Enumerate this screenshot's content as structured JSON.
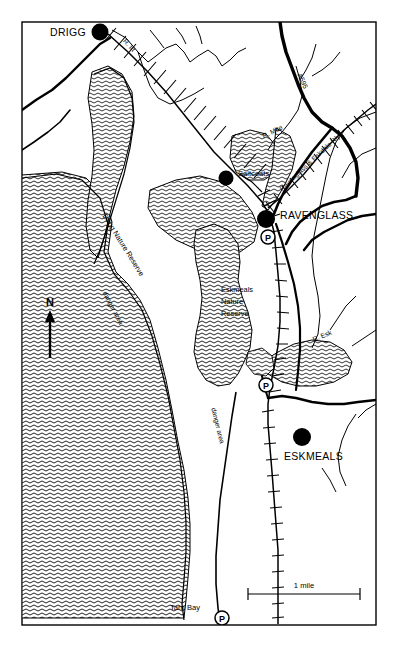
{
  "map": {
    "title": "Ravenglass, Drigg and Eskmeals area map",
    "frame": {
      "stroke": "#000000"
    },
    "background_color": "#ffffff",
    "ink_color": "#000000",
    "towns": [
      {
        "id": "drigg",
        "label": "DRIGG",
        "marker": "filled-circle"
      },
      {
        "id": "ravenglass",
        "label": "RAVENGLASS",
        "marker": "filled-circle"
      },
      {
        "id": "eskmeals",
        "label": "ESKMEALS",
        "marker": "filled-circle"
      }
    ],
    "places": [
      {
        "id": "saltcoats",
        "label": "Saltcoats",
        "marker": "filled-circle"
      },
      {
        "id": "tarn-bay",
        "label": "Tarn Bay",
        "marker": "none"
      }
    ],
    "reserves": [
      {
        "id": "drigg-nature-reserve",
        "label": "Drigg Nature Reserve",
        "orientation": "rotated"
      },
      {
        "id": "eskmeals-nature-reserve",
        "line1": "Eskmeals",
        "line2": "Nature",
        "line3": "Reserve",
        "orientation": "horizontal"
      }
    ],
    "danger_areas": [
      {
        "id": "danger-area-north",
        "label": "danger area"
      },
      {
        "id": "danger-area-south",
        "label": "danger area"
      }
    ],
    "rivers": [
      {
        "id": "river-irt",
        "label": "R. Irt"
      },
      {
        "id": "river-mite",
        "label": "R. Mite"
      },
      {
        "id": "river-esk",
        "label": "R. Esk"
      }
    ],
    "roads": [
      {
        "id": "a595",
        "label": "A595",
        "type": "primary"
      }
    ],
    "railways": [
      {
        "id": "ravenglass-eskdale-rly",
        "label": "Ravenglass & Eskdale Rly",
        "type": "narrow-gauge"
      },
      {
        "id": "main-line",
        "label": "",
        "type": "main-line"
      }
    ],
    "parking_markers": [
      {
        "id": "parking-ravenglass",
        "label": "P"
      },
      {
        "id": "parking-eskmeals",
        "label": "P"
      },
      {
        "id": "parking-tarn-bay",
        "label": "P"
      }
    ],
    "compass": {
      "label": "N",
      "direction": "up"
    },
    "scale_bar": {
      "label": "1 mile",
      "units": "mile",
      "value": 1
    }
  }
}
